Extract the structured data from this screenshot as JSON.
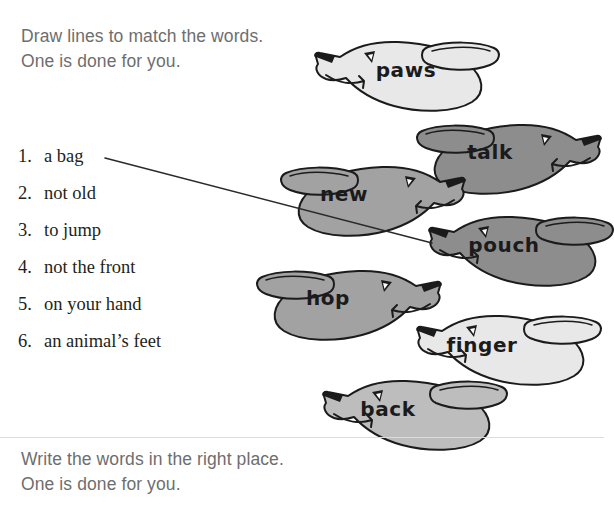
{
  "instructions": {
    "top_line1": "Draw lines to match the words.",
    "top_line2": "One is done for you.",
    "bottom_line1": "Write the words in the right place.",
    "bottom_line2": "One is done for you."
  },
  "word_list": {
    "items": [
      {
        "num": "1.",
        "text": "a bag"
      },
      {
        "num": "2.",
        "text": "not old"
      },
      {
        "num": "3.",
        "text": "to jump"
      },
      {
        "num": "4.",
        "text": "not the front"
      },
      {
        "num": "5.",
        "text": "on your hand"
      },
      {
        "num": "6.",
        "text": "an animal’s feet"
      }
    ]
  },
  "dogs": [
    {
      "word": "paws",
      "fill": "#e8e8e8",
      "facing": "left",
      "x": 302,
      "y": 33,
      "word_x": 104,
      "word_y": 44
    },
    {
      "word": "talk",
      "fill": "#8d8d8d",
      "facing": "right",
      "x": 418,
      "y": 116,
      "word_x": 72,
      "word_y": 43
    },
    {
      "word": "new",
      "fill": "#a2a2a2",
      "facing": "right",
      "x": 282,
      "y": 158,
      "word_x": 62,
      "word_y": 43
    },
    {
      "word": "pouch",
      "fill": "#8d8d8d",
      "facing": "left",
      "x": 416,
      "y": 208,
      "word_x": 88,
      "word_y": 44
    },
    {
      "word": "hop",
      "fill": "#a2a2a2",
      "facing": "right",
      "x": 258,
      "y": 262,
      "word_x": 70,
      "word_y": 43
    },
    {
      "word": "finger",
      "fill": "#e8e8e8",
      "facing": "left",
      "x": 404,
      "y": 307,
      "word_x": 78,
      "word_y": 45
    },
    {
      "word": "back",
      "fill": "#bdbdbd",
      "facing": "left",
      "x": 310,
      "y": 372,
      "word_x": 78,
      "word_y": 44
    }
  ],
  "connector": {
    "x1": 105,
    "y1": 158,
    "x2": 432,
    "y2": 243,
    "color": "#2a2a2a"
  },
  "colors": {
    "text_gray": "#6e6e6e",
    "list_black": "#231f20",
    "outline": "#1b1b1b",
    "divider": "#dcdcdc"
  }
}
